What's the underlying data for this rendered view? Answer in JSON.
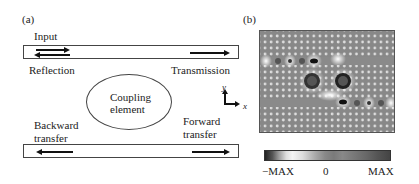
{
  "panel_a": {
    "label": "(a)",
    "input": "Input",
    "reflection": "Reflection",
    "transmission": "Transmission",
    "coupling_line1": "Coupling",
    "coupling_line2": "element",
    "backward_line1": "Backward",
    "backward_line2": "transfer",
    "forward_line1": "Forward",
    "forward_line2": "transfer",
    "axis_y": "y",
    "axis_x": "x"
  },
  "panel_b": {
    "label": "(b)",
    "colorbar": {
      "min_label": "−MAX",
      "mid_label": "0",
      "max_label": "MAX"
    }
  }
}
